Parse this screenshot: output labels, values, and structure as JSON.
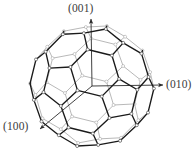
{
  "figure": {
    "name": "fullerene-c60-crystal-axes",
    "background_color": "#ffffff",
    "canvas": {
      "width": 196,
      "height": 152
    }
  },
  "molecule": {
    "type": "truncated-icosahedron",
    "vertex_count": 60,
    "edge_count": 90,
    "face_counts": {
      "hexagons": 20,
      "pentagons": 12
    },
    "center": {
      "x": 92,
      "y": 86
    },
    "radius": 62,
    "front_edge_color": "#1a1a1a",
    "back_edge_color": "#9a9a9a",
    "vertex_fill_color": "#ffffff",
    "vertex_stroke_color": "#555555",
    "front_edge_width": 1.35,
    "back_edge_width": 0.7,
    "vertex_radius": 1.5
  },
  "axes": {
    "origin": {
      "x": 92,
      "y": 86
    },
    "arrow_color": "#2b2b2b",
    "arrow_width": 0.9,
    "items": [
      {
        "id": "axis-001",
        "label": "(001)",
        "direction": "up",
        "tip": {
          "x": 91,
          "y": 19
        },
        "label_position": {
          "left": 68,
          "top": 3
        }
      },
      {
        "id": "axis-010",
        "label": "(010)",
        "direction": "right",
        "tip": {
          "x": 163,
          "y": 85
        },
        "label_position": {
          "left": 166,
          "top": 79
        }
      },
      {
        "id": "axis-100",
        "label": "(100)",
        "direction": "down-left",
        "tip": {
          "x": 40,
          "y": 129
        },
        "label_position": {
          "left": 3,
          "top": 121
        }
      }
    ]
  },
  "labels": {
    "top": "(001)",
    "right": "(010)",
    "bottom_left": "(100)"
  }
}
